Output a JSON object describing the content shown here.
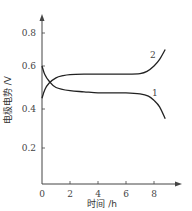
{
  "chart_data": {
    "type": "line",
    "title": "",
    "xlabel": "时间 /h",
    "ylabel": "电极电势 /V",
    "xlim": [
      0,
      9.5
    ],
    "ylim": [
      0,
      0.9
    ],
    "xticks": [
      "0",
      "2",
      "4",
      "6",
      "8"
    ],
    "yticks": [
      "0.2",
      "0.4",
      "0.6",
      "0.8"
    ],
    "grid": false,
    "legend": "inline curve labels",
    "series": [
      {
        "name": "1",
        "x": [
          0,
          0.2,
          0.5,
          1,
          2,
          3,
          4,
          5,
          6,
          7,
          7.6,
          8,
          8.4,
          8.8
        ],
        "y": [
          0.6,
          0.56,
          0.53,
          0.5,
          0.485,
          0.48,
          0.475,
          0.475,
          0.475,
          0.47,
          0.46,
          0.44,
          0.41,
          0.35
        ]
      },
      {
        "name": "2",
        "x": [
          0,
          0.2,
          0.5,
          1,
          1.5,
          2,
          3,
          4,
          5,
          6,
          7,
          7.5,
          8,
          8.4,
          8.8
        ],
        "y": [
          0.45,
          0.49,
          0.52,
          0.545,
          0.555,
          0.56,
          0.562,
          0.562,
          0.562,
          0.562,
          0.565,
          0.575,
          0.6,
          0.64,
          0.7
        ]
      }
    ]
  },
  "labels": {
    "curve1": "1",
    "curve2": "2",
    "xlabel": "时间 /h",
    "ylabel": "电极电势 /V"
  }
}
